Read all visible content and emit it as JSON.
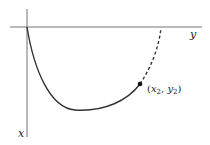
{
  "diagram": {
    "axes": {
      "horizontal_label": "y",
      "vertical_label": "x"
    },
    "point": {
      "label_open": "(",
      "x_sym": "x",
      "x_sub": "2",
      "comma": ", ",
      "y_sym": "y",
      "y_sub": "2",
      "label_close": ")"
    },
    "colors": {
      "axis": "#777777",
      "curve": "#333333",
      "point": "#111111"
    }
  }
}
